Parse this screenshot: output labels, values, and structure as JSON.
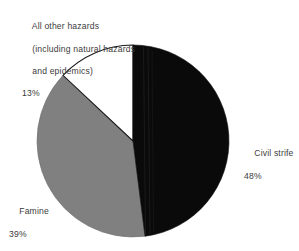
{
  "chart_data": {
    "type": "pie",
    "title": "",
    "subtitle": "",
    "xlabel": "",
    "ylabel": "",
    "grid": false,
    "legend_position": "callout-labels",
    "total_percent": 100,
    "start_angle_deg": 0,
    "direction": "clockwise",
    "categories": [
      "Civil strife",
      "Famine",
      "All other hazards (including natural hazards and epidemics)"
    ],
    "values": [
      48,
      39,
      13
    ],
    "value_unit": "%",
    "slices": [
      {
        "label": "Civil strife",
        "label_line1": "Civil strife",
        "percent": 48,
        "percent_text": "48%",
        "color": "#0a0a0a",
        "outline": "#0a0a0a",
        "start_angle_deg": 0,
        "end_angle_deg": 172.8
      },
      {
        "label": "Famine",
        "label_line1": "Famine",
        "percent": 39,
        "percent_text": "39%",
        "color": "#808080",
        "outline": "#6e6e6e",
        "start_angle_deg": 172.8,
        "end_angle_deg": 313.2
      },
      {
        "label": "All other hazards (including natural hazards and epidemics)",
        "label_line1": "All other hazards",
        "label_line2": "(including natural hazards",
        "label_line3": "and epidemics)",
        "percent": 13,
        "percent_text": "13%",
        "color": "#ffffff",
        "outline": "#1a1a1a",
        "start_angle_deg": 313.2,
        "end_angle_deg": 360
      }
    ],
    "geometry": {
      "center_x": 133,
      "center_y": 141,
      "radius": 96
    },
    "colors": {
      "civil_strife": "#0a0a0a",
      "famine": "#808080",
      "all_other_hazards": "#ffffff",
      "text": "#3b3b3b",
      "background": "#ffffff"
    }
  },
  "labels": {
    "other_hazards": {
      "line1": "All other hazards",
      "line2": "(including natural hazards",
      "line3": "and epidemics)",
      "percent": "13%"
    },
    "famine": {
      "line1": "Famine",
      "percent": "39%"
    },
    "civil_strife": {
      "line1": "Civil strife",
      "percent": "48%"
    }
  }
}
